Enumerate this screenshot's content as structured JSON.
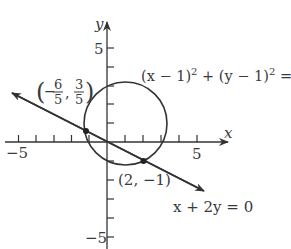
{
  "diagram": {
    "type": "coordinate-plane",
    "axes": {
      "x_label": "x",
      "y_label": "y",
      "x_ticks": [
        -5,
        -4,
        -3,
        -2,
        -1,
        1,
        2,
        3,
        4,
        5
      ],
      "y_ticks": [
        -5,
        -4,
        -3,
        -2,
        -1,
        1,
        2,
        3,
        4,
        5
      ],
      "x_tick_labels": {
        "neg": "−5",
        "pos": "5"
      },
      "y_tick_labels": {
        "neg": "−5",
        "pos": "5"
      }
    },
    "circle": {
      "equation_parts": {
        "a": "(x − 1)",
        "a_exp": "2",
        "plus": " + ",
        "b": "(y − 1)",
        "b_exp": "2",
        "rhs": " = 5"
      },
      "center": [
        1,
        1
      ],
      "radius_squared": 5
    },
    "line": {
      "equation": "x + 2y = 0"
    },
    "points": [
      {
        "label_open": "(−",
        "num1": "6",
        "den1": "5",
        "sep": ",",
        "num2": "3",
        "den2": "5",
        "label_close": ")",
        "coords": [
          -1.2,
          0.6
        ]
      },
      {
        "label": "(2, −1)",
        "coords": [
          2,
          -1
        ]
      }
    ]
  },
  "colors": {
    "stroke": "#333333",
    "text": "#3a3a3a",
    "background": "#ffffff"
  }
}
